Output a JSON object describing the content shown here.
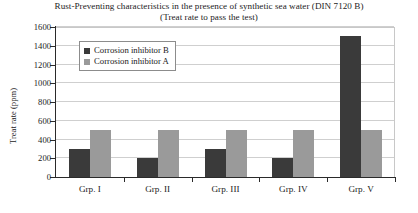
{
  "chart_data": {
    "type": "bar",
    "title": "Rust-Preventing characteristics in the presence of synthetic sea water (DIN 7120 B)",
    "subtitle": "(Treat rate to pass the test)",
    "xlabel": "",
    "ylabel": "Treat rate (ppm)",
    "categories": [
      "Grp. I",
      "Grp. II",
      "Grp. III",
      "Grp. IV",
      "Grp. V"
    ],
    "series": [
      {
        "name": "Corrosion inhibitor B",
        "color": "#3a3a3a",
        "values": [
          300,
          200,
          300,
          200,
          1500
        ]
      },
      {
        "name": "Corrosion inhibitor A",
        "color": "#9a9a9a",
        "values": [
          500,
          500,
          500,
          500,
          500
        ]
      }
    ],
    "ylim": [
      0,
      1600
    ],
    "yticks": [
      0,
      200,
      400,
      600,
      800,
      1000,
      1200,
      1400,
      1600
    ],
    "ytick_labels": [
      "0",
      "200",
      "400",
      "600",
      "800",
      "1000",
      "1200",
      "1400",
      "1600"
    ],
    "grid": true,
    "legend_position": "upper-left"
  }
}
